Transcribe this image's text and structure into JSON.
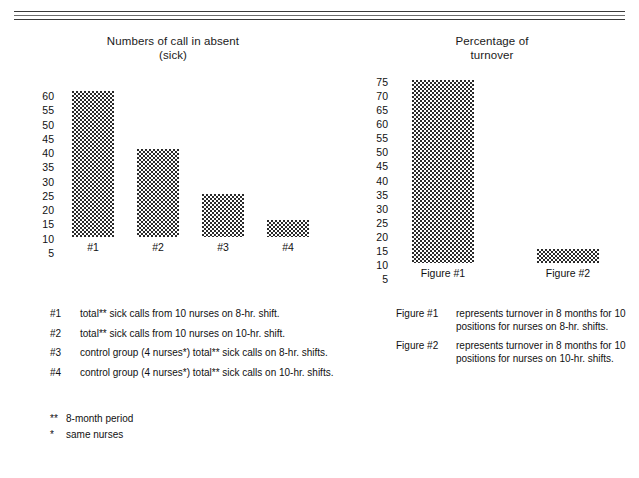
{
  "document": {
    "type": "scanned-report-page",
    "rule_count": 3
  },
  "chart_data": [
    {
      "id": "sick-calls",
      "type": "bar",
      "title": "Numbers of call in absent",
      "subtitle": "(sick)",
      "title_full": "Numbers of call in absent (sick)",
      "xlabel": "",
      "ylabel": "",
      "categories": [
        "#1",
        "#2",
        "#3",
        "#4"
      ],
      "values": [
        56,
        36,
        20,
        11
      ],
      "yticks": [
        60,
        55,
        50,
        45,
        40,
        35,
        30,
        25,
        20,
        15,
        10,
        5
      ],
      "ylim": [
        0,
        62
      ],
      "grid": false,
      "legend_position": "below",
      "legend": [
        {
          "key": "#1",
          "text": "total** sick calls from 10 nurses on 8-hr. shift."
        },
        {
          "key": "#2",
          "text": "total** sick calls from 10 nurses on 10-hr. shift."
        },
        {
          "key": "#3",
          "text": "control group (4 nurses*) total** sick calls on 8-hr. shifts."
        },
        {
          "key": "#4",
          "text": "control group (4 nurses*) total** sick calls on 10-hr. shifts."
        }
      ]
    },
    {
      "id": "turnover",
      "type": "bar",
      "title": "Percentage of",
      "subtitle": "turnover",
      "title_full": "Percentage of turnover",
      "xlabel": "",
      "ylabel": "",
      "categories": [
        "Figure #1",
        "Figure #2"
      ],
      "values": [
        70,
        10
      ],
      "yticks": [
        75,
        70,
        65,
        60,
        55,
        50,
        45,
        40,
        35,
        30,
        25,
        20,
        15,
        10,
        5
      ],
      "ylim": [
        0,
        78
      ],
      "grid": false,
      "legend_position": "below",
      "legend": [
        {
          "key": "Figure #1",
          "text": "represents turnover in 8 months for 10 positions for nurses on 8-hr. shifts."
        },
        {
          "key": "Figure #2",
          "text": "represents turnover in 8 months for 10 positions for nurses on 10-hr. shifts."
        }
      ]
    }
  ],
  "notes": [
    {
      "mark": "**",
      "text": "8-month period"
    },
    {
      "mark": "*",
      "text": "same nurses"
    }
  ]
}
